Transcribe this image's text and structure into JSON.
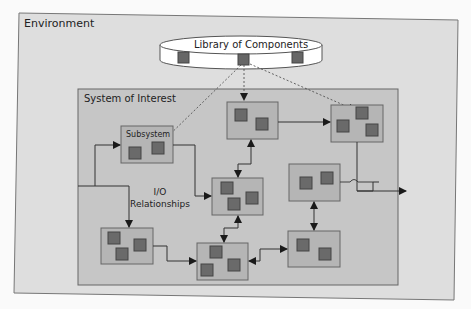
{
  "diagram": {
    "environment_label": "Environment",
    "library_label": "Library of Components",
    "system_label": "System of Interest",
    "subsystem_label": "Subsystem",
    "io_label_line1": "I/O",
    "io_label_line2": "Relationships"
  },
  "colors": {
    "page_bg": "#fafafa",
    "environment_fill": "#dcdcdc",
    "system_fill": "#c4c4c4",
    "subsystem_fill": "#b5b5b5",
    "component_fill": "#6a6a6a",
    "stroke": "#555555"
  }
}
